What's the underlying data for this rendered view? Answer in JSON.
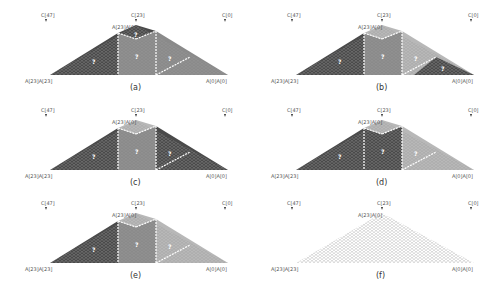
{
  "figure": {
    "colors": {
      "dark": "#4a4a4a",
      "medium": "#8a8a8a",
      "light": "#b8b8b8",
      "empty": "#ffffff",
      "lattice": "#9a9a9a",
      "boundary": "#ffffff"
    },
    "labels": {
      "top_left": "C[47]",
      "top_mid": "C[23]",
      "top_right": "C[0]",
      "apex": "A[23]A[0]",
      "bottom_left": "A[23]A[23]",
      "bottom_right": "A[0]A[0]"
    },
    "region_label_note": "Region markers inside panels are not legible at source resolution; shown as placeholders.",
    "panels": [
      {
        "caption": "(a)",
        "regions": [
          {
            "label": "?",
            "shade": "dark",
            "pos": "left"
          },
          {
            "label": "?",
            "shade": "medium",
            "pos": "center"
          },
          {
            "label": "?",
            "shade": "medium",
            "pos": "right"
          },
          {
            "label": "?",
            "shade": "dark",
            "pos": "apex"
          }
        ]
      },
      {
        "caption": "(b)",
        "regions": [
          {
            "label": "?",
            "shade": "dark",
            "pos": "left"
          },
          {
            "label": "?",
            "shade": "medium",
            "pos": "center"
          },
          {
            "label": "?",
            "shade": "light",
            "pos": "right"
          },
          {
            "label": "?",
            "shade": "dark",
            "pos": "bottom-right"
          }
        ]
      },
      {
        "caption": "(c)",
        "regions": [
          {
            "label": "?",
            "shade": "dark",
            "pos": "left"
          },
          {
            "label": "?",
            "shade": "medium",
            "pos": "center"
          },
          {
            "label": "?",
            "shade": "dark",
            "pos": "right"
          }
        ]
      },
      {
        "caption": "(d)",
        "regions": [
          {
            "label": "?",
            "shade": "dark",
            "pos": "left"
          },
          {
            "label": "?",
            "shade": "dark",
            "pos": "center"
          },
          {
            "label": "?",
            "shade": "light",
            "pos": "right"
          }
        ]
      },
      {
        "caption": "(e)",
        "regions": [
          {
            "label": "?",
            "shade": "dark",
            "pos": "left"
          },
          {
            "label": "?",
            "shade": "medium",
            "pos": "center"
          },
          {
            "label": "?",
            "shade": "light",
            "pos": "right"
          }
        ]
      },
      {
        "caption": "(f)",
        "regions": []
      }
    ]
  }
}
